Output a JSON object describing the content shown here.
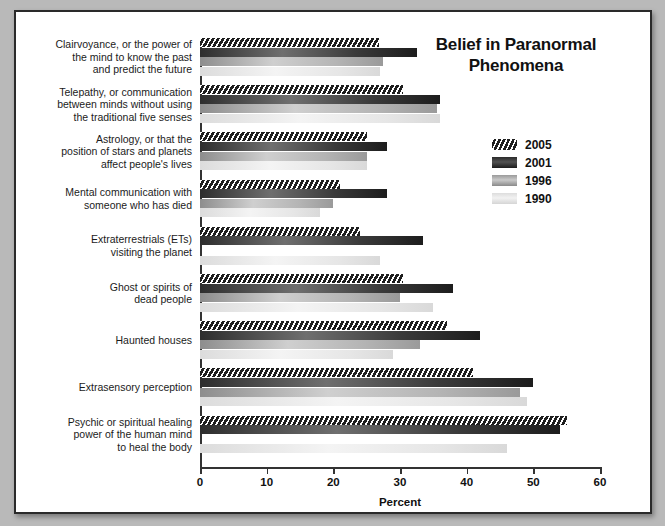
{
  "chart_data": {
    "type": "bar",
    "orientation": "horizontal",
    "title": "Belief in Paranormal Phenomena",
    "title_lines": [
      "Belief in Paranormal",
      "Phenomena"
    ],
    "xlabel": "Percent",
    "ylabel": "",
    "xlim": [
      0,
      60
    ],
    "xticks": [
      0,
      10,
      20,
      30,
      40,
      50,
      60
    ],
    "xtick_labels": [
      "0",
      "10",
      "20",
      "30",
      "40",
      "50",
      "60"
    ],
    "grid": false,
    "legend_position": "upper-right",
    "categories": [
      "Clairvoyance, or the power of the mind to know the past and predict the future",
      "Telepathy, or communication between minds without using the traditional five senses",
      "Astrology, or that the position of stars and planets affect people's lives",
      "Mental communication with someone who has died",
      "Extraterrestrials (ETs) visiting the planet",
      "Ghost or spirits of dead people",
      "Haunted houses",
      "Extrasensory perception",
      "Psychic or spiritual healing power of the human mind to heal the body"
    ],
    "category_lines": [
      [
        "Clairvoyance, or the power of",
        "the mind to know the past",
        "and predict the future"
      ],
      [
        "Telepathy, or communication",
        "between minds without using",
        "the traditional five senses"
      ],
      [
        "Astrology, or that the",
        "position of stars and planets",
        "affect people's lives"
      ],
      [
        "Mental communication with",
        "someone who has died"
      ],
      [
        "Extraterrestrials (ETs)",
        "visiting the planet"
      ],
      [
        "Ghost or spirits of",
        "dead people"
      ],
      [
        "Haunted houses"
      ],
      [
        "Extrasensory perception"
      ],
      [
        "Psychic or spiritual healing",
        "power of the human mind",
        "to heal the body"
      ]
    ],
    "series": [
      {
        "name": "2005",
        "pattern": "diagonal-hatch",
        "color": "#242424",
        "values": [
          26.9,
          30.5,
          25.0,
          21.0,
          24.0,
          30.5,
          37.0,
          41.0,
          55.0
        ]
      },
      {
        "name": "2001",
        "pattern": "solid-dark",
        "color": "#3a3a3a",
        "values": [
          32.5,
          36.0,
          28.0,
          28.0,
          33.5,
          38.0,
          42.0,
          50.0,
          54.0
        ]
      },
      {
        "name": "1996",
        "pattern": "solid-mid-gray",
        "color": "#b4b4b4",
        "values": [
          27.5,
          35.5,
          25.0,
          20.0,
          null,
          30.0,
          33.0,
          48.0,
          null
        ]
      },
      {
        "name": "1990",
        "pattern": "solid-light-gray",
        "color": "#e6e6e6",
        "values": [
          27.0,
          36.0,
          25.0,
          18.0,
          27.0,
          35.0,
          29.0,
          49.0,
          46.0
        ]
      }
    ]
  }
}
